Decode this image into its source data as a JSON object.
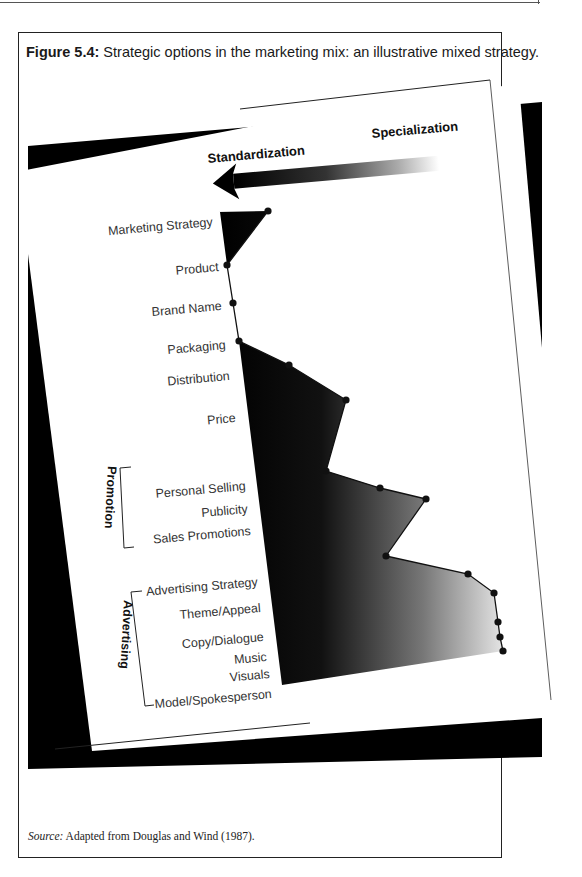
{
  "figure": {
    "number_label": "Figure 5.4:",
    "title": "Strategic options in the marketing mix: an illustrative mixed strategy.",
    "source_label": "Source:",
    "source_text": "Adapted from Douglas and Wind (1987)."
  },
  "axis": {
    "left_label": "Standardization",
    "right_label": "Specialization",
    "arrow_icon": "left-arrow-gradient"
  },
  "groups": {
    "promotion": "Promotion",
    "advertising": "Advertising"
  },
  "chart_data": {
    "type": "line",
    "title": "Strategic options in the marketing mix: an illustrative mixed strategy",
    "orientation": "horizontal-profile",
    "xlabel": "Standardization ← → Specialization",
    "xscale": "0 = fully standardized, 10 = fully specialized (estimated)",
    "categories": [
      "Marketing Strategy",
      "Product",
      "Brand Name",
      "Packaging",
      "Distribution",
      "Price",
      "Personal Selling",
      "Publicity",
      "Sales Promotions",
      "Advertising Strategy",
      "Theme/Appeal",
      "Copy/Dialogue",
      "Music",
      "Visuals",
      "Model/Spokesperson"
    ],
    "category_groups": {
      "Promotion": [
        "Personal Selling",
        "Publicity",
        "Sales Promotions"
      ],
      "Advertising": [
        "Advertising Strategy",
        "Theme/Appeal",
        "Copy/Dialogue",
        "Music",
        "Visuals",
        "Model/Spokesperson"
      ]
    },
    "series": [
      {
        "name": "Mixed strategy",
        "values": [
          1.5,
          0.0,
          0.2,
          0.3,
          1.8,
          3.6,
          2.8,
          4.5,
          6.0,
          4.5,
          8.6,
          9.4,
          9.6,
          9.7,
          9.8
        ]
      }
    ],
    "points_px": [
      [
        268,
        211
      ],
      [
        227,
        265
      ],
      [
        233,
        303
      ],
      [
        239,
        341
      ],
      [
        289,
        365
      ],
      [
        346,
        400
      ],
      [
        326,
        471
      ],
      [
        380,
        488
      ],
      [
        426,
        499
      ],
      [
        386,
        556
      ],
      [
        468,
        574
      ],
      [
        494,
        593
      ],
      [
        498,
        622
      ],
      [
        500,
        637
      ],
      [
        503,
        651
      ]
    ],
    "legend": "none",
    "grid": false
  }
}
